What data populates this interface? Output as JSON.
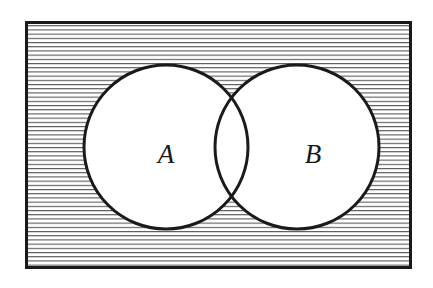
{
  "figure": {
    "kind": "venn-diagram",
    "caption_text": "",
    "background_color": "#ffffff"
  },
  "universe": {
    "name": "universal-set-rectangle",
    "label": "",
    "x": 25,
    "y": 21,
    "width": 387,
    "height": 248,
    "border_color": "#1a1a1a",
    "border_width": 3,
    "fill_description": "horizontal-line-hatching",
    "hatch_color": "#555555",
    "hatch_spacing": 4.2,
    "hatch_line_width": 1.1,
    "hatch_base_color": "#ffffff"
  },
  "sets": [
    {
      "name": "set-a",
      "label": "A",
      "cx": 166,
      "cy": 147,
      "r": 82,
      "fill": "#ffffff",
      "stroke": "#1a1a1a",
      "stroke_width": 3,
      "label_x": 166,
      "label_y": 163
    },
    {
      "name": "set-b",
      "label": "B",
      "cx": 297,
      "cy": 147,
      "r": 82,
      "fill": "#ffffff",
      "stroke": "#1a1a1a",
      "stroke_width": 3,
      "label_x": 313,
      "label_y": 163
    }
  ],
  "intersection": {
    "name": "set-intersection-lens",
    "label": "",
    "upper_crossing_x": 232,
    "upper_crossing_y": 85,
    "lower_crossing_x": 232,
    "lower_crossing_y": 209,
    "fill": "#ffffff",
    "shaded": false
  },
  "shading": {
    "shaded_region_description": "complement of A union B",
    "unshaded_region_description": "A union B"
  },
  "chart_data": {
    "type": "venn",
    "title": "",
    "set_labels": [
      "A",
      "B"
    ],
    "regions": [
      {
        "id": "A-only",
        "shaded": false
      },
      {
        "id": "B-only",
        "shaded": false
      },
      {
        "id": "A-and-B",
        "shaded": false
      },
      {
        "id": "outside-A-and-B",
        "shaded": true
      }
    ],
    "legend": [],
    "annotations": []
  }
}
